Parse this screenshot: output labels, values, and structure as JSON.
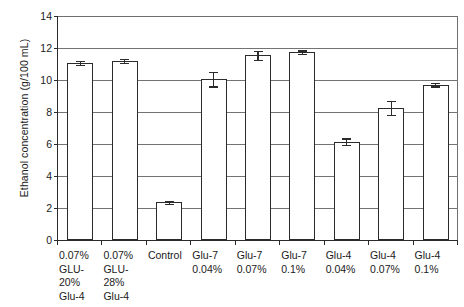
{
  "chart_data": {
    "type": "bar",
    "title": "",
    "xlabel": "",
    "ylabel": "Ethanol concentration (g/100 mL)",
    "ylim": [
      0,
      14
    ],
    "ytick_step": 2,
    "yticks": [
      "14",
      "12",
      "10",
      "8",
      "6",
      "4",
      "2",
      "0"
    ],
    "grid": true,
    "legend": "none",
    "categories": [
      "0.07% GLU- 20% Glu-4",
      "0.07% GLU- 28% Glu-4",
      "Control",
      "Glu-7 0.04%",
      "Glu-7 0.07%",
      "Glu-7 0.1%",
      "Glu-4 0.04%",
      "Glu-4 0.07%",
      "Glu-4 0.1%"
    ],
    "category_lines": [
      [
        "0.07%",
        "GLU-",
        "20%",
        "Glu-4"
      ],
      [
        "0.07%",
        "GLU-",
        "28%",
        "Glu-4"
      ],
      [
        "Control"
      ],
      [
        "Glu-7",
        "0.04%"
      ],
      [
        "Glu-7",
        "0.07%"
      ],
      [
        "Glu-7",
        "0.1%"
      ],
      [
        "Glu-4",
        "0.04%"
      ],
      [
        "Glu-4",
        "0.07%"
      ],
      [
        "Glu-4",
        "0.1%"
      ]
    ],
    "values": [
      11.05,
      11.2,
      2.35,
      10.05,
      11.55,
      11.75,
      6.15,
      8.25,
      9.7
    ],
    "errors": [
      0.12,
      0.12,
      0.08,
      0.45,
      0.28,
      0.1,
      0.2,
      0.45,
      0.1
    ],
    "bar_color": "#ffffff",
    "bar_edge_color": "#2b2b2b",
    "grid_color": "#737373",
    "axis_color": "#2b2b2b"
  }
}
